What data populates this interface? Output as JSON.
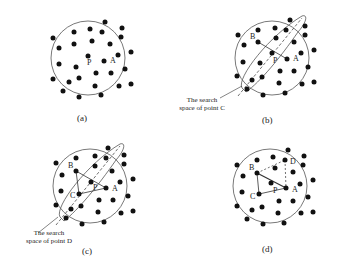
{
  "panels": [
    {
      "id": "a",
      "caption": "(a)",
      "labels": {
        "P": "P",
        "A": "A"
      }
    },
    {
      "id": "b",
      "caption": "(b)",
      "labels": {
        "P": "P",
        "A": "A",
        "B": "B"
      },
      "annotation": [
        "The search",
        "space of point C"
      ]
    },
    {
      "id": "c",
      "caption": "(c)",
      "labels": {
        "P": "P",
        "A": "A",
        "B": "B",
        "C": "C"
      },
      "annotation": [
        "The search",
        "space of point D"
      ]
    },
    {
      "id": "d",
      "caption": "(d)",
      "labels": {
        "P": "P",
        "A": "A",
        "B": "B",
        "C": "C",
        "D": "D"
      }
    }
  ],
  "colors": {
    "dot": "#111111",
    "circle": "#555555",
    "line": "#333333"
  }
}
